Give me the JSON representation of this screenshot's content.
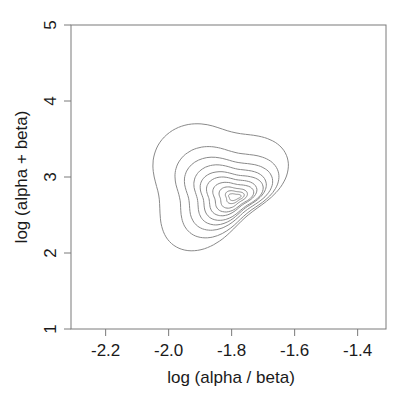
{
  "chart_data": {
    "type": "contour",
    "title": "",
    "xlabel": "log (alpha / beta)",
    "ylabel": "log (alpha + beta)",
    "xlim": [
      -2.31,
      -1.31
    ],
    "ylim": [
      1,
      5
    ],
    "x_ticks": [
      -2.2,
      -2.0,
      -1.8,
      -1.6,
      -1.4
    ],
    "x_tick_labels": [
      "-2.2",
      "-2.0",
      "-1.8",
      "-1.6",
      "-1.4"
    ],
    "y_ticks": [
      1,
      2,
      3,
      4,
      5
    ],
    "y_tick_labels": [
      "1",
      "2",
      "3",
      "4",
      "5"
    ],
    "grid": false,
    "legend": null,
    "mode": {
      "x": -1.79,
      "y": 2.75
    },
    "contour_count": 10,
    "contours": [
      {
        "level": 1,
        "x_range": [
          -2.05,
          -1.62
        ],
        "y_range": [
          2.03,
          3.7
        ]
      },
      {
        "level": 2,
        "x_range": [
          -1.98,
          -1.65
        ],
        "y_range": [
          2.2,
          3.4
        ]
      },
      {
        "level": 3,
        "x_range": [
          -1.95,
          -1.67
        ],
        "y_range": [
          2.3,
          3.26
        ]
      },
      {
        "level": 4,
        "x_range": [
          -1.92,
          -1.69
        ],
        "y_range": [
          2.37,
          3.16
        ]
      },
      {
        "level": 5,
        "x_range": [
          -1.9,
          -1.7
        ],
        "y_range": [
          2.43,
          3.07
        ]
      },
      {
        "level": 6,
        "x_range": [
          -1.88,
          -1.72
        ],
        "y_range": [
          2.49,
          3.0
        ]
      },
      {
        "level": 7,
        "x_range": [
          -1.86,
          -1.73
        ],
        "y_range": [
          2.54,
          2.93
        ]
      },
      {
        "level": 8,
        "x_range": [
          -1.84,
          -1.75
        ],
        "y_range": [
          2.59,
          2.87
        ]
      },
      {
        "level": 9,
        "x_range": [
          -1.82,
          -1.76
        ],
        "y_range": [
          2.65,
          2.82
        ]
      },
      {
        "level": 10,
        "x_range": [
          -1.81,
          -1.77
        ],
        "y_range": [
          2.69,
          2.78
        ]
      }
    ]
  },
  "colors": {
    "axis": "#7a7a7a",
    "contour": "#8a8a8a",
    "text": "#1a1a1a",
    "background": "#ffffff"
  }
}
